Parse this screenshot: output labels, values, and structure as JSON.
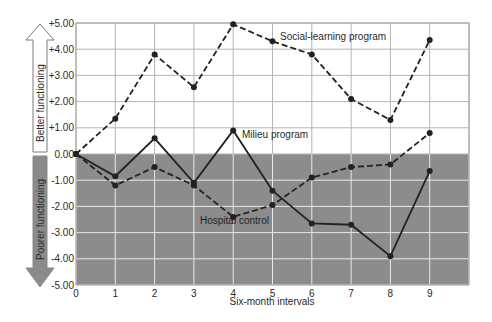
{
  "chart_data": {
    "type": "line",
    "title": "",
    "xlabel": "Six-month intervals",
    "ylabel": "",
    "x": [
      0,
      1,
      2,
      3,
      4,
      5,
      6,
      7,
      8,
      9
    ],
    "xlim": [
      0,
      10
    ],
    "ylim": [
      -5,
      5
    ],
    "y_ticks": [
      "+5.00",
      "+4.00",
      "+3.00",
      "+2.00",
      "+1.00",
      "0.00",
      "-1.00",
      "-2.00",
      "-3.00",
      "-4.00",
      "-5.00"
    ],
    "x_ticks": [
      "0",
      "1",
      "2",
      "3",
      "4",
      "5",
      "6",
      "7",
      "8",
      "9"
    ],
    "grid": true,
    "legend_position": "inline labels",
    "series": [
      {
        "name": "Social-learning program",
        "style": "dashed",
        "values": [
          0.0,
          1.35,
          3.8,
          2.55,
          4.95,
          4.3,
          3.8,
          2.1,
          1.3,
          4.35
        ]
      },
      {
        "name": "Milieu program",
        "style": "solid",
        "values": [
          0.0,
          -0.85,
          0.6,
          -1.1,
          0.9,
          -1.4,
          -2.65,
          -2.7,
          -3.9,
          -0.65
        ]
      },
      {
        "name": "Hospital control",
        "style": "dashed",
        "values": [
          0.0,
          -1.2,
          -0.5,
          -1.2,
          -2.4,
          -1.95,
          -0.9,
          -0.5,
          -0.4,
          0.8
        ]
      }
    ],
    "annotations": [
      "Better functioning",
      "Poorer functioning"
    ],
    "shaded_region": "below 0.00 (gray)"
  },
  "labels": {
    "better": "Better functioning",
    "poorer": "Poorer functioning",
    "xlabel": "Six-month intervals",
    "social": "Social-learning program",
    "milieu": "Milieu program",
    "hospital": "Hospital control"
  },
  "colors": {
    "shade": "#8c8c8c",
    "grid_upper": "#b5b5b5",
    "grid_lower": "#e8e8e8",
    "line": "#222222"
  }
}
